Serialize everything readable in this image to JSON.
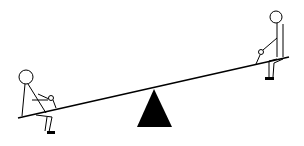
{
  "scene": {
    "description": "Stick-figure seesaw illustration",
    "colors": {
      "stroke": "#000000",
      "background": "#ffffff",
      "fulcrum": "#000000"
    },
    "board": {
      "x1": 18,
      "y1": 118,
      "x2": 289,
      "y2": 57
    },
    "fulcrum": {
      "apex": [
        154,
        89
      ],
      "base_left": [
        137,
        127
      ],
      "base_right": [
        172,
        127
      ]
    },
    "figures": [
      {
        "name": "left-person",
        "position": "low end"
      },
      {
        "name": "right-person",
        "position": "high end"
      }
    ]
  }
}
